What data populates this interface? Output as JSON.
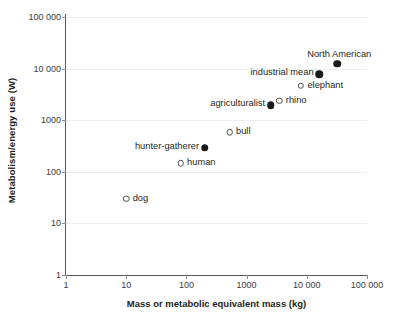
{
  "chart_data": {
    "type": "scatter",
    "title": "",
    "xlabel": "Mass or metabolic equivalent mass (kg)",
    "ylabel": "Metabolism/energy use (W)",
    "xscale": "log",
    "yscale": "log",
    "xlim": [
      1,
      100000
    ],
    "ylim": [
      1,
      100000
    ],
    "grid": true,
    "legend": "none",
    "xticks": [
      {
        "value": 1,
        "label": "1"
      },
      {
        "value": 10,
        "label": "10"
      },
      {
        "value": 100,
        "label": "100"
      },
      {
        "value": 1000,
        "label": "1000"
      },
      {
        "value": 10000,
        "label": "10 000"
      },
      {
        "value": 100000,
        "label": "100 000"
      }
    ],
    "yticks": [
      {
        "value": 1,
        "label": "1"
      },
      {
        "value": 10,
        "label": "10"
      },
      {
        "value": 100,
        "label": "100"
      },
      {
        "value": 1000,
        "label": "1000"
      },
      {
        "value": 10000,
        "label": "10 000"
      },
      {
        "value": 100000,
        "label": "100 000"
      }
    ],
    "marker_styles": {
      "open": "open circle (animal / biological metabolism)",
      "filled": "filled circle (human society energy use)"
    },
    "points": [
      {
        "name": "dog",
        "label": "dog",
        "x": 10,
        "y": 30,
        "marker": "open",
        "label_pos": "right"
      },
      {
        "name": "human",
        "label": "human",
        "x": 80,
        "y": 145,
        "marker": "open",
        "label_pos": "right"
      },
      {
        "name": "hunter-gatherer",
        "label": "hunter-gatherer",
        "x": 200,
        "y": 290,
        "marker": "filled",
        "label_pos": "left"
      },
      {
        "name": "bull",
        "label": "bull",
        "x": 520,
        "y": 580,
        "marker": "open",
        "label_pos": "right"
      },
      {
        "name": "agriculturalist",
        "label": "agriculturalist",
        "x": 2500,
        "y": 1950,
        "marker": "filled",
        "label_pos": "left"
      },
      {
        "name": "rhino",
        "label": "rhino",
        "x": 3500,
        "y": 2400,
        "marker": "open",
        "label_pos": "right"
      },
      {
        "name": "elephant",
        "label": "elephant",
        "x": 8000,
        "y": 4700,
        "marker": "open",
        "label_pos": "right"
      },
      {
        "name": "industrial-mean",
        "label": "industrial mean",
        "x": 16000,
        "y": 7700,
        "marker": "filled",
        "label_pos": "left"
      },
      {
        "name": "north-american",
        "label": "North American",
        "x": 32000,
        "y": 12500,
        "marker": "filled",
        "label_pos": "above"
      }
    ]
  }
}
